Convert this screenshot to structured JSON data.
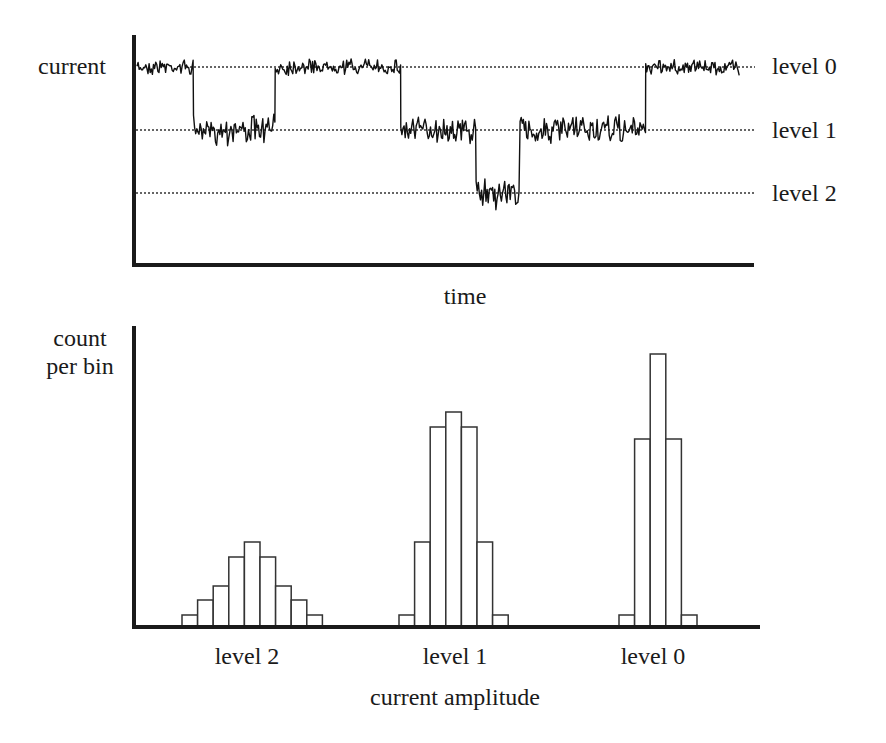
{
  "top_panel": {
    "ylabel": "current",
    "xlabel": "time",
    "level_labels": [
      "level 0",
      "level 1",
      "level 2"
    ]
  },
  "bottom_panel": {
    "ylabel_line1": "count",
    "ylabel_line2": "per bin",
    "xlabel": "current amplitude",
    "category_labels": [
      "level 2",
      "level 1",
      "level 0"
    ]
  },
  "colors": {
    "trace": "#111111",
    "axis": "#1a1a1a",
    "bar_fill": "#ffffff",
    "bar_stroke": "#333333",
    "guide": "#333333"
  },
  "chart_data": [
    {
      "type": "line",
      "title": "",
      "xlabel": "time",
      "ylabel": "current",
      "grid": false,
      "reference_lines": [
        {
          "name": "level 0",
          "relative_current": 0
        },
        {
          "name": "level 1",
          "relative_current": -1
        },
        {
          "name": "level 2",
          "relative_current": -2
        }
      ],
      "segments": [
        {
          "t_start": 0.0,
          "t_end": 0.09,
          "level": 0
        },
        {
          "t_start": 0.09,
          "t_end": 0.22,
          "level": 1
        },
        {
          "t_start": 0.22,
          "t_end": 0.42,
          "level": 0
        },
        {
          "t_start": 0.42,
          "t_end": 0.54,
          "level": 1
        },
        {
          "t_start": 0.54,
          "t_end": 0.61,
          "level": 2
        },
        {
          "t_start": 0.61,
          "t_end": 0.81,
          "level": 1
        },
        {
          "t_start": 0.81,
          "t_end": 0.96,
          "level": 0
        }
      ],
      "note": "noisy single-channel current trace switching between three discrete levels"
    },
    {
      "type": "bar",
      "title": "",
      "xlabel": "current amplitude",
      "ylabel": "count per bin",
      "categories": [
        "level 2",
        "level 1",
        "level 0"
      ],
      "grid": false,
      "series": [
        {
          "name": "level 2",
          "bins": 9,
          "values": [
            12,
            27,
            41,
            70,
            85,
            70,
            41,
            27,
            12
          ]
        },
        {
          "name": "level 1",
          "bins": 7,
          "values": [
            12,
            85,
            200,
            215,
            200,
            85,
            12
          ]
        },
        {
          "name": "level 0",
          "bins": 5,
          "values": [
            12,
            188,
            273,
            188,
            12
          ]
        }
      ],
      "units_note": "relative bar heights (arbitrary units, no y ticks shown)"
    }
  ]
}
